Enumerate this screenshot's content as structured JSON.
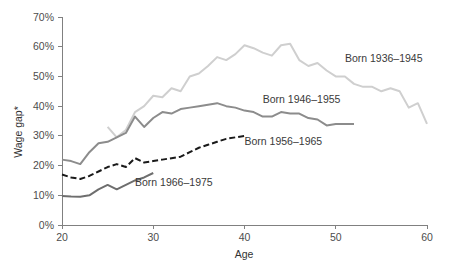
{
  "chart_data": {
    "type": "line",
    "title": "",
    "xlabel": "Age",
    "ylabel": "Wage gap*",
    "xlim": [
      20,
      60
    ],
    "ylim": [
      0,
      70
    ],
    "grid": false,
    "legend_position": "inline-annotations",
    "x_ticks": [
      "20",
      "30",
      "40",
      "50",
      "60"
    ],
    "x_tick_values": [
      20,
      30,
      40,
      50,
      60
    ],
    "y_ticks": [
      "0%",
      "10%",
      "20%",
      "30%",
      "40%",
      "50%",
      "60%",
      "70%"
    ],
    "y_tick_values": [
      0,
      10,
      20,
      30,
      40,
      50,
      60,
      70
    ],
    "series": [
      {
        "name": "Born 1936–1945",
        "color": "#cfcfcf",
        "style": "solid",
        "width": 2,
        "label_x": 51,
        "label_y": 55,
        "x": [
          25,
          26,
          27,
          28,
          29,
          30,
          31,
          32,
          33,
          34,
          35,
          36,
          37,
          38,
          39,
          40,
          41,
          42,
          43,
          44,
          45,
          46,
          47,
          48,
          49,
          50,
          51,
          52,
          53,
          54,
          55,
          56,
          57,
          58,
          59,
          60
        ],
        "values": [
          33.0,
          29.5,
          32.0,
          38.0,
          40.0,
          43.5,
          43.0,
          46.0,
          45.0,
          50.0,
          51.0,
          53.5,
          56.5,
          55.5,
          57.5,
          60.5,
          59.5,
          58.0,
          57.0,
          60.5,
          61.0,
          55.5,
          53.5,
          54.5,
          52.0,
          50.0,
          50.0,
          47.5,
          46.5,
          46.5,
          45.0,
          46.0,
          45.0,
          39.5,
          41.0,
          34.0
        ]
      },
      {
        "name": "Born 1946–1955",
        "color": "#8c8c8c",
        "style": "solid",
        "width": 2,
        "label_x": 42,
        "label_y": 41,
        "x": [
          20,
          21,
          22,
          23,
          24,
          25,
          26,
          27,
          28,
          29,
          30,
          31,
          32,
          33,
          34,
          35,
          36,
          37,
          38,
          39,
          40,
          41,
          42,
          43,
          44,
          45,
          46,
          47,
          48,
          49,
          50,
          51,
          52
        ],
        "values": [
          22.0,
          21.5,
          20.5,
          24.5,
          27.5,
          28.0,
          29.5,
          31.0,
          36.5,
          33.0,
          36.0,
          38.0,
          37.5,
          39.0,
          39.5,
          40.0,
          40.5,
          41.0,
          40.0,
          39.5,
          38.5,
          38.0,
          36.5,
          36.5,
          38.0,
          37.5,
          37.5,
          36.0,
          35.5,
          33.5,
          34.0,
          34.0,
          34.0
        ]
      },
      {
        "name": "Born 1956–1965",
        "color": "#1a1a1a",
        "style": "dashed",
        "width": 2,
        "label_x": 40,
        "label_y": 27,
        "x": [
          20,
          21,
          22,
          23,
          24,
          25,
          26,
          27,
          28,
          29,
          30,
          31,
          32,
          33,
          34,
          35,
          36,
          37,
          38,
          39,
          40
        ],
        "values": [
          17.0,
          16.0,
          15.5,
          16.5,
          18.0,
          19.5,
          20.5,
          19.5,
          22.5,
          21.0,
          21.5,
          22.0,
          22.5,
          23.0,
          24.5,
          26.0,
          27.0,
          28.0,
          29.0,
          29.5,
          30.0
        ]
      },
      {
        "name": "Born 1966–1975",
        "color": "#6e6e6e",
        "style": "solid",
        "width": 2,
        "label_x": 28,
        "label_y": 13,
        "x": [
          20,
          21,
          22,
          23,
          24,
          25,
          26,
          27,
          28,
          29,
          30
        ],
        "values": [
          9.8,
          9.6,
          9.5,
          10.0,
          12.0,
          13.5,
          12.0,
          13.5,
          15.0,
          16.0,
          17.5
        ]
      }
    ]
  }
}
